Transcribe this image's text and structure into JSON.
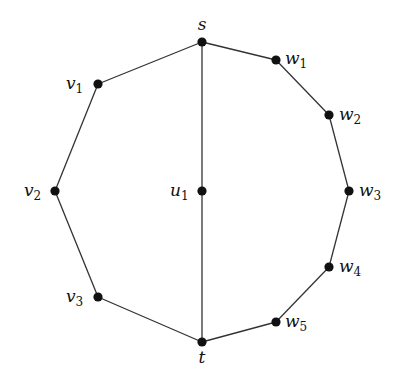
{
  "diagram": {
    "type": "graph",
    "nodes": [
      {
        "id": "s",
        "label": "s",
        "sub": "",
        "x": 202,
        "y": 42,
        "lx": 202,
        "ly": 30,
        "anchor": "middle"
      },
      {
        "id": "w1",
        "label": "w",
        "sub": "1",
        "x": 276,
        "y": 60,
        "lx": 285,
        "ly": 64,
        "anchor": "start"
      },
      {
        "id": "w2",
        "label": "w",
        "sub": "2",
        "x": 329,
        "y": 115,
        "lx": 339,
        "ly": 120,
        "anchor": "start"
      },
      {
        "id": "w3",
        "label": "w",
        "sub": "3",
        "x": 349,
        "y": 191,
        "lx": 359,
        "ly": 196,
        "anchor": "start"
      },
      {
        "id": "w4",
        "label": "w",
        "sub": "4",
        "x": 329,
        "y": 267,
        "lx": 339,
        "ly": 272,
        "anchor": "start"
      },
      {
        "id": "w5",
        "label": "w",
        "sub": "5",
        "x": 276,
        "y": 322,
        "lx": 285,
        "ly": 327,
        "anchor": "start"
      },
      {
        "id": "t",
        "label": "t",
        "sub": "",
        "x": 202,
        "y": 342,
        "lx": 202,
        "ly": 363,
        "anchor": "middle"
      },
      {
        "id": "v3",
        "label": "v",
        "sub": "3",
        "x": 98,
        "y": 297,
        "lx": 66,
        "ly": 302,
        "anchor": "start"
      },
      {
        "id": "v2",
        "label": "v",
        "sub": "2",
        "x": 55,
        "y": 191,
        "lx": 24,
        "ly": 196,
        "anchor": "start"
      },
      {
        "id": "v1",
        "label": "v",
        "sub": "1",
        "x": 98,
        "y": 84,
        "lx": 66,
        "ly": 89,
        "anchor": "start"
      },
      {
        "id": "u1",
        "label": "u",
        "sub": "1",
        "x": 202,
        "y": 191,
        "lx": 170,
        "ly": 196,
        "anchor": "start"
      }
    ],
    "edges": [
      [
        "s",
        "w1"
      ],
      [
        "w1",
        "w2"
      ],
      [
        "w2",
        "w3"
      ],
      [
        "w3",
        "w4"
      ],
      [
        "w4",
        "w5"
      ],
      [
        "w5",
        "t"
      ],
      [
        "t",
        "v3"
      ],
      [
        "v3",
        "v2"
      ],
      [
        "v2",
        "v1"
      ],
      [
        "v1",
        "s"
      ],
      [
        "s",
        "u1"
      ],
      [
        "u1",
        "t"
      ]
    ],
    "colors": {
      "edge": "#333333",
      "node": "#111111",
      "background": "#ffffff"
    }
  }
}
